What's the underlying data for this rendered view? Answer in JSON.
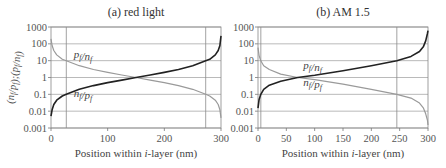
{
  "chart_data": [
    {
      "type": "line",
      "title": "(a) red light",
      "xlabel": "Position within i-layer (nm)",
      "ylabel": "(n_f/p_f);(p_f/n_f)",
      "xlim": [
        0,
        300
      ],
      "ylim": [
        0.001,
        1000
      ],
      "yscale": "log",
      "xticks": [
        "0",
        "100",
        "200",
        "300"
      ],
      "yticks": [
        "1000",
        "100",
        "10",
        "1",
        "0.1",
        "0.01",
        "0.001"
      ],
      "grid": true,
      "vlines": [
        27,
        273
      ],
      "series": [
        {
          "name": "p_f/n_f",
          "color": "#9a9a9a",
          "x": [
            0,
            2,
            5,
            10,
            20,
            27,
            50,
            75,
            100,
            125,
            150,
            175,
            200,
            225,
            250,
            273,
            280,
            290,
            295,
            298,
            300
          ],
          "y": [
            200,
            80,
            40,
            22,
            12,
            10,
            5,
            3,
            2,
            1.4,
            1,
            0.7,
            0.5,
            0.33,
            0.2,
            0.1,
            0.08,
            0.045,
            0.025,
            0.012,
            0.004
          ]
        },
        {
          "name": "n_f/p_f",
          "color": "#222222",
          "x": [
            0,
            2,
            5,
            10,
            20,
            27,
            50,
            75,
            100,
            125,
            150,
            175,
            200,
            225,
            250,
            273,
            280,
            290,
            295,
            298,
            300
          ],
          "y": [
            0.005,
            0.012,
            0.025,
            0.045,
            0.08,
            0.1,
            0.2,
            0.33,
            0.5,
            0.7,
            1,
            1.4,
            2,
            3,
            5,
            10,
            12,
            22,
            40,
            80,
            300
          ]
        }
      ],
      "annotations": [
        {
          "text": "p_f/n_f",
          "x": 40,
          "y": 15
        },
        {
          "text": "n_f/p_f",
          "x": 40,
          "y": 0.07
        }
      ]
    },
    {
      "type": "line",
      "title": "(b) AM 1.5",
      "xlabel": "Position within i-layer (nm)",
      "ylabel": "",
      "xlim": [
        0,
        300
      ],
      "ylim": [
        0.001,
        1000
      ],
      "yscale": "log",
      "xticks": [
        "0",
        "50",
        "100",
        "150",
        "200",
        "250",
        "300"
      ],
      "yticks": [
        "1000",
        "100",
        "10",
        "1",
        "0.1",
        "0.01",
        "0.001"
      ],
      "grid": true,
      "vlines": [
        5,
        245
      ],
      "series": [
        {
          "name": "p_f/n_f",
          "color": "#9a9a9a",
          "x": [
            0,
            2,
            5,
            10,
            20,
            40,
            70,
            100,
            150,
            200,
            245,
            270,
            285,
            292,
            296,
            299,
            300
          ],
          "y": [
            60,
            20,
            10,
            5,
            3,
            1.6,
            1,
            0.75,
            0.4,
            0.2,
            0.1,
            0.06,
            0.03,
            0.015,
            0.007,
            0.003,
            0.0015
          ]
        },
        {
          "name": "n_f/p_f",
          "color": "#222222",
          "x": [
            0,
            2,
            5,
            10,
            20,
            40,
            70,
            100,
            150,
            200,
            245,
            270,
            285,
            292,
            296,
            299,
            300
          ],
          "y": [
            0.015,
            0.05,
            0.1,
            0.2,
            0.35,
            0.6,
            1,
            1.35,
            2.5,
            5,
            10,
            18,
            35,
            70,
            150,
            400,
            600
          ]
        }
      ],
      "annotations": [
        {
          "text": "p_f/n_f",
          "x": 80,
          "y": 3
        },
        {
          "text": "n_f/p_f",
          "x": 80,
          "y": 0.3
        }
      ]
    }
  ],
  "panels": {
    "a": {
      "title": "(a) red light",
      "xlabel_pre": "Position within ",
      "xlabel_it": "i",
      "xlabel_post": "-layer (nm)"
    },
    "b": {
      "title": "(b) AM 1.5",
      "xlabel_pre": "Position within ",
      "xlabel_it": "i",
      "xlabel_post": "-layer (nm)"
    }
  }
}
